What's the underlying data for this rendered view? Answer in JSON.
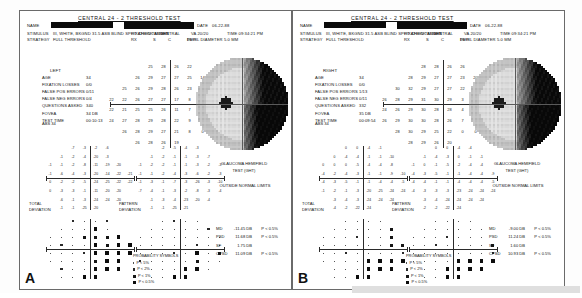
{
  "figure": {
    "panel_labels": [
      "A",
      "B"
    ]
  },
  "header": {
    "title": "CENTRAL  24 - 2  THRESHOLD TEST",
    "name_label": "NAME",
    "stimulus_label": "STIMULUS",
    "stimulus_value": "III, WHITE, BKGND 31.5 ASB  BLIND SPOT CHECK SIZE  III",
    "strategy_label": "STRATEGY",
    "strategy_value": "FULL THRESHOLD",
    "date_label": "DATE",
    "date_value": "06-22-88",
    "fixation_target_label": "FIXATION TARGET",
    "fixation_target_value": "CENTRAL",
    "pupil_diameter_label": "PUPIL DIAMETER",
    "pupil_diameter_value": "5.0 MM",
    "vacuity_label": "VA",
    "vacuity_value": "20/20",
    "rx_label": "RX",
    "rx_s": "S",
    "rx_c": "C",
    "rx_deg": "DEG",
    "time_label": "TIME",
    "time_value": "09:34:21 PM",
    "date_short": "DC"
  },
  "panels": [
    {
      "id": "A",
      "eye": "LEFT",
      "reliability": [
        {
          "label": "AGE",
          "value": "34"
        },
        {
          "label": "FIXATION LOSSES",
          "value": "0/0"
        },
        {
          "label": "FALSE POS ERRORS",
          "value": "0/11"
        },
        {
          "label": "FALSE NEG ERRORS",
          "value": "0/4"
        },
        {
          "label": "QUESTIONS ASKED",
          "value": "340"
        },
        {
          "label": "FOVEA",
          "value": "34 DB"
        },
        {
          "label": "TEST TIME",
          "value": "00:10:13"
        }
      ],
      "fovea_note": "ABS 34",
      "threshold_title": "",
      "threshold_grid": [
        [
          null,
          null,
          null,
          "25",
          "28",
          "26",
          "22",
          null,
          null,
          null
        ],
        [
          null,
          null,
          "26",
          "29",
          "27",
          "27",
          "25",
          "14",
          null,
          null
        ],
        [
          null,
          "25",
          "26",
          "29",
          "28",
          "26",
          "23",
          "6",
          "0",
          null
        ],
        [
          "22",
          "22",
          "26",
          "27",
          "27",
          "17",
          "8",
          "4",
          "1",
          "0"
        ],
        [
          "22",
          "21",
          "25",
          "25",
          "26",
          "11",
          "7",
          "4",
          "0",
          "0"
        ],
        [
          "24",
          "27",
          "28",
          "29",
          "28",
          "22",
          "9",
          "6",
          null,
          null
        ],
        [
          null,
          "26",
          "28",
          "29",
          "27",
          "21",
          "8",
          "0",
          null,
          null
        ],
        [
          null,
          null,
          "26",
          "28",
          "26",
          "19",
          null,
          null,
          null,
          null
        ]
      ],
      "total_deviation": [
        [
          null,
          null,
          "-7",
          "-3",
          "-2",
          "-6",
          null,
          null
        ],
        [
          null,
          "-1",
          "-2",
          "-4",
          "-20",
          "-3",
          null,
          null
        ],
        [
          "-1",
          "-1",
          "-2",
          "-8",
          "-11",
          "-19",
          "-20",
          null
        ],
        [
          "-1",
          "-6",
          "-4",
          "-3",
          "-20",
          "-14",
          "-22",
          "-21"
        ],
        [
          "0",
          "-2",
          "-2",
          "-5",
          "-24",
          "-25",
          "-22",
          "-22"
        ],
        [
          "0",
          "-3",
          "-3",
          "-1",
          "-11",
          "-20",
          "-20",
          null
        ],
        [
          null,
          "-6",
          "-1",
          "-3",
          "-24",
          "-24",
          "-20",
          null
        ],
        [
          null,
          "-1",
          "-1",
          "-25",
          "-20",
          null,
          null,
          null
        ]
      ],
      "pattern_deviation": [
        [
          null,
          null,
          "-2",
          "-5",
          "-4",
          "-3",
          null,
          null
        ],
        [
          null,
          "-1",
          "-2",
          "-1",
          "-1",
          "-3",
          "-7",
          null
        ],
        [
          "-1",
          "-2",
          "-2",
          "-1",
          "-1",
          "-3",
          "-2",
          "-3"
        ],
        [
          "-1",
          "-1",
          "-2",
          "-4",
          "-3",
          "-6",
          "-2",
          "-3"
        ],
        [
          "-1",
          "-3",
          "-1",
          "-7",
          "-3",
          "-26",
          "-3",
          "-10"
        ],
        [
          "-7",
          "-4",
          "-1",
          "-3",
          "-2",
          "-8",
          "-3",
          "-4"
        ],
        [
          null,
          "-1",
          "-3",
          "-4",
          "-23",
          "-20",
          "-4",
          null
        ],
        [
          null,
          "-1",
          "-1",
          "-25",
          "-21",
          null,
          null,
          null
        ]
      ],
      "ght_title": "GLAUCOMA HEMIFIELD",
      "ght_title2": "TEST (GHT)",
      "ght_result": "OUTSIDE NORMAL LIMITS",
      "total_dev_label_1": "TOTAL",
      "total_dev_label_2": "DEVIATION",
      "pattern_dev_label_1": "PATTERN",
      "pattern_dev_label_2": "DEVIATION",
      "probability_title": "PROBABILITY SYMBOLS",
      "probability_items": [
        {
          "sym": "dots",
          "text": "P < 5%"
        },
        {
          "sym": "light",
          "text": "P < 2%"
        },
        {
          "sym": "mid",
          "text": "P < 1%"
        },
        {
          "sym": "solid",
          "text": "P < 0.5%"
        }
      ],
      "indices": [
        {
          "key": "MD",
          "value": "-11.45 DB",
          "p": "P < 0.5%"
        },
        {
          "key": "PSD",
          "value": "11.68 DB",
          "p": "P < 0.5%"
        },
        {
          "key": "SF",
          "value": "1.75 DB",
          "p": ""
        },
        {
          "key": "CPSD",
          "value": "11.09 DB",
          "p": "P < 0.5%"
        }
      ]
    },
    {
      "id": "B",
      "eye": "RIGHT",
      "reliability": [
        {
          "label": "AGE",
          "value": "34"
        },
        {
          "label": "FIXATION LOSSES",
          "value": "0/0"
        },
        {
          "label": "FALSE POS ERRORS",
          "value": "1/13"
        },
        {
          "label": "FALSE NEG ERRORS",
          "value": "0/11"
        },
        {
          "label": "QUESTIONS ASKED",
          "value": "332"
        },
        {
          "label": "FOVEA",
          "value": "35 DB"
        },
        {
          "label": "TEST TIME",
          "value": "00:09:54"
        }
      ],
      "fovea_note": "ABS 34",
      "threshold_grid": [
        [
          null,
          null,
          null,
          "28",
          "28",
          "26",
          "26",
          null,
          null,
          null
        ],
        [
          null,
          null,
          "28",
          "29",
          "27",
          "27",
          "23",
          "20",
          null,
          null
        ],
        [
          null,
          "30",
          "32",
          "29",
          "27",
          "27",
          "22",
          "2",
          "0",
          null
        ],
        [
          "26",
          "28",
          "29",
          "31",
          "30",
          "29",
          "3",
          "1",
          "1",
          "0"
        ],
        [
          "24",
          "26",
          "29",
          "30",
          "28",
          "28",
          "4",
          "0",
          "0",
          "0"
        ],
        [
          "26",
          "29",
          "30",
          "30",
          "28",
          "26",
          "7",
          "0",
          null,
          null
        ],
        [
          null,
          "28",
          "30",
          "29",
          "25",
          "22",
          "0",
          "0",
          null,
          null
        ],
        [
          null,
          null,
          "28",
          "29",
          "26",
          "20",
          null,
          null,
          null,
          null
        ]
      ],
      "total_deviation": [
        [
          null,
          null,
          "0",
          "0",
          "-4",
          "-1",
          null,
          null
        ],
        [
          null,
          "0",
          "-4",
          "-4",
          "-1",
          "-1",
          "-10",
          null
        ],
        [
          "0",
          "0",
          "0",
          "-5",
          "-4",
          "-4",
          "-8",
          null
        ],
        [
          "-4",
          "-2",
          "-4",
          "-3",
          "-1",
          "-1",
          "-9",
          "-10"
        ],
        [
          "-4",
          "-3",
          "-5",
          "-1",
          "-1",
          "-4",
          "-4",
          "-5"
        ],
        [
          "-1",
          "-2",
          "-1",
          "-3",
          "-20",
          "-25",
          "-24",
          "-24"
        ],
        [
          null,
          "-3",
          "-4",
          "-3",
          "-24",
          "-24",
          "-24",
          null
        ],
        [
          null,
          "-4",
          "-2",
          "-22",
          "-24",
          null,
          null,
          null
        ]
      ],
      "pattern_deviation": [
        [
          null,
          null,
          "0",
          "0",
          "-4",
          "-4",
          null,
          null
        ],
        [
          null,
          "-1",
          "-4",
          "-3",
          "0",
          "-1",
          "-1",
          null
        ],
        [
          "-1",
          "0",
          "-1",
          "-5",
          "-2",
          "-4",
          "-4",
          null
        ],
        [
          "-4",
          "-3",
          "-5",
          "-1",
          "-1",
          "-4",
          "-4",
          "-9"
        ],
        [
          "-4",
          "-4",
          "-1",
          "-1",
          "-4",
          "-4",
          "-4",
          "-5"
        ],
        [
          "-4",
          "-3",
          "-3",
          "-3",
          "-23",
          "-24",
          "-24",
          "-24"
        ],
        [
          null,
          "-3",
          "-4",
          "-24",
          "-24",
          "-24",
          "-24",
          null
        ],
        [
          null,
          "-2",
          "-2",
          "-22",
          "-24",
          null,
          null,
          null
        ]
      ],
      "ght_title": "GLAUCOMA HEMIFIELD",
      "ght_title2": "TEST (GHT)",
      "ght_result": "OUTSIDE NORMAL LIMITS",
      "total_dev_label_1": "TOTAL",
      "total_dev_label_2": "DEVIATION",
      "pattern_dev_label_1": "PATTERN",
      "pattern_dev_label_2": "DEVIATION",
      "probability_title": "PROBABILITY SYMBOLS",
      "probability_items": [
        {
          "sym": "dots",
          "text": "P < 5%"
        },
        {
          "sym": "light",
          "text": "P < 2%"
        },
        {
          "sym": "mid",
          "text": "P < 1%"
        },
        {
          "sym": "solid",
          "text": "P < 0.5%"
        }
      ],
      "indices": [
        {
          "key": "MD",
          "value": "-9.00 DB",
          "p": "P < 0.5%"
        },
        {
          "key": "PSD",
          "value": "11.24 DB",
          "p": "P < 0.5%"
        },
        {
          "key": "SF",
          "value": "1.60 DB",
          "p": ""
        },
        {
          "key": "CPSD",
          "value": "10.93 DB",
          "p": "P < 0.5%"
        }
      ]
    }
  ],
  "colors": {
    "ink": "#141414",
    "frame": "#6a6a6a",
    "paper": "#ffffff",
    "redaction": "#0b0b0b"
  }
}
